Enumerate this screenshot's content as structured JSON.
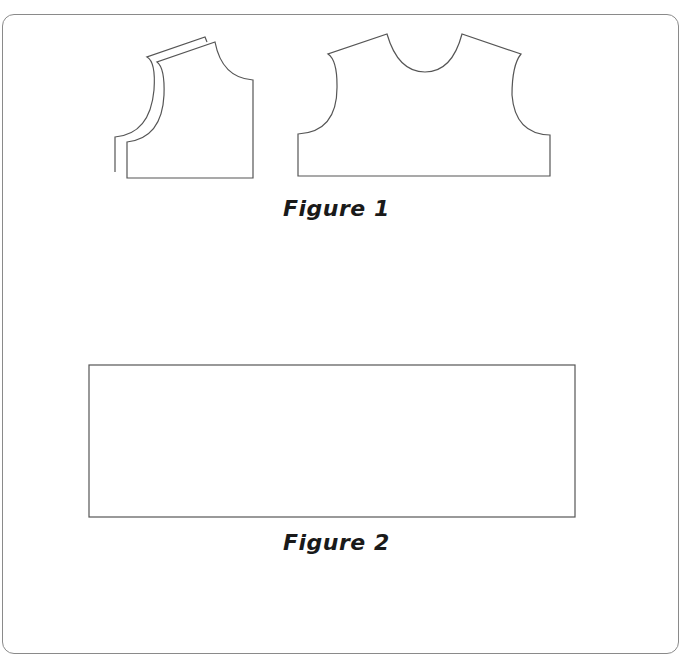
{
  "figures": [
    {
      "caption": "Figure 1",
      "pieces": [
        "back-bodice-piece",
        "front-bodice-piece"
      ]
    },
    {
      "caption": "Figure 2",
      "pieces": [
        "rectangle-skirt-piece"
      ]
    }
  ],
  "colors": {
    "line": "#555555",
    "frame": "#8a8a8a",
    "text": "#1a1a1a"
  }
}
